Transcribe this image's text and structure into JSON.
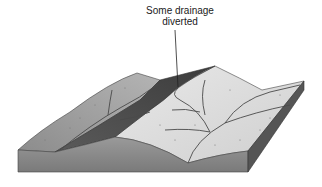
{
  "diagram": {
    "annotation": {
      "line1": "Some drainage",
      "line2": "diverted"
    },
    "colors": {
      "front_face": "#8a8a8a",
      "side_face": "#5a5a5a",
      "left_slope": "#9a9a9a",
      "dark_valley": "#4e4e4e",
      "right_plain": "#dcdcdc",
      "channel": "#555555",
      "leader_line": "#222222"
    }
  }
}
